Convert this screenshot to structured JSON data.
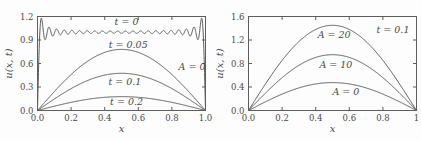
{
  "figure": {
    "background": "#fdfdfd",
    "line_color": "#5d5d5d",
    "text_color": "#4a4a4a"
  },
  "chart_data": [
    {
      "id": "left",
      "type": "line",
      "title": "",
      "xlabel": "x",
      "ylabel": "u(x, t)",
      "xlim": [
        0,
        1
      ],
      "ylim": [
        0,
        1.2
      ],
      "xticks": [
        "0.0",
        "0.2",
        "0.4",
        "0.6",
        "0.8",
        "1.0"
      ],
      "yticks": [
        "0.0",
        "0.3",
        "0.6",
        "0.9",
        "1.2"
      ],
      "grid": false,
      "series": [
        {
          "name": "t = 0",
          "shape": "fourier_square",
          "terms": 22,
          "amplitude": 1.0,
          "description": "truncated Fourier sine series of u=1, oscillates about 1 with Gibbs overshoot ~1.18 near x=0 and x=1, u(0)=u(1)=0"
        },
        {
          "name": "t = 0.05",
          "shape": "sine",
          "amplitude": 0.78,
          "peak_x": 0.5
        },
        {
          "name": "t = 0.1",
          "shape": "sine",
          "amplitude": 0.475,
          "peak_x": 0.5
        },
        {
          "name": "t = 0.2",
          "shape": "sine",
          "amplitude": 0.177,
          "peak_x": 0.5
        }
      ],
      "annotations": [
        {
          "text": "t = 0",
          "x": 0.53,
          "y": 1.13
        },
        {
          "text": "t = 0.05",
          "x": 0.54,
          "y": 0.84
        },
        {
          "text": "A = 0",
          "x": 0.92,
          "y": 0.56
        },
        {
          "text": "t = 0.1",
          "x": 0.52,
          "y": 0.37
        },
        {
          "text": "t = 0.2",
          "x": 0.53,
          "y": 0.11
        }
      ]
    },
    {
      "id": "right",
      "type": "line",
      "title": "",
      "xlabel": "x",
      "ylabel": "u(x, t)",
      "xlim": [
        0,
        1
      ],
      "ylim": [
        0,
        1.6
      ],
      "xticks": [
        "0.0",
        "0.2",
        "0.4",
        "0.6",
        "0.8",
        "1"
      ],
      "yticks": [
        "0.0",
        "0.4",
        "0.8",
        "1.2",
        "1.6"
      ],
      "grid": false,
      "series": [
        {
          "name": "A = 20",
          "shape": "sine",
          "amplitude": 1.45,
          "peak_x": 0.5
        },
        {
          "name": "A = 10",
          "shape": "sine",
          "amplitude": 0.95,
          "peak_x": 0.5
        },
        {
          "name": "A = 0",
          "shape": "sine",
          "amplitude": 0.475,
          "peak_x": 0.5
        }
      ],
      "annotations": [
        {
          "text": "t = 0.1",
          "x": 0.86,
          "y": 1.37
        },
        {
          "text": "A = 20",
          "x": 0.51,
          "y": 1.28
        },
        {
          "text": "A = 10",
          "x": 0.52,
          "y": 0.78
        },
        {
          "text": "A = 0",
          "x": 0.58,
          "y": 0.32
        }
      ]
    }
  ]
}
